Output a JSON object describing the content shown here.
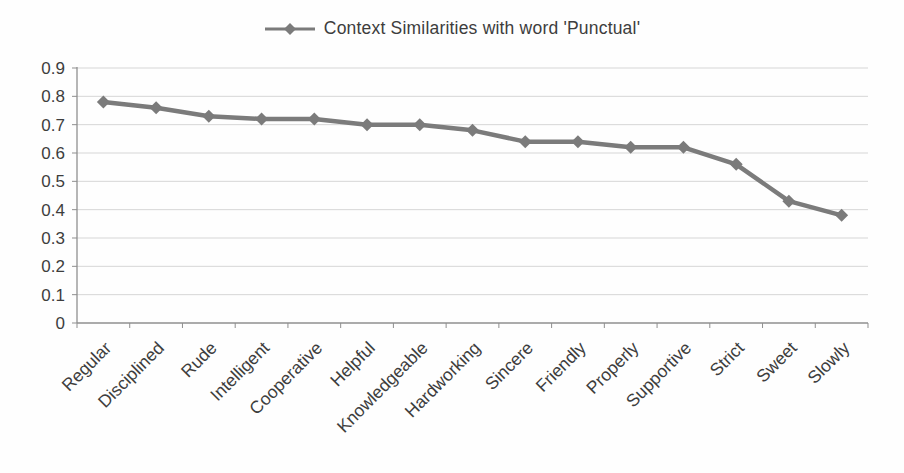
{
  "chart_data": {
    "type": "line",
    "title": "",
    "legend": "Context Similarities with word 'Punctual'",
    "legend_position": "top",
    "marker": "diamond",
    "grid": true,
    "categories": [
      "Regular",
      "Disciplined",
      "Rude",
      "Intelligent",
      "Cooperative",
      "Helpful",
      "Knowledgeable",
      "Hardworking",
      "Sincere",
      "Friendly",
      "Properly",
      "Supportive",
      "Strict",
      "Sweet",
      "Slowly"
    ],
    "values": [
      0.78,
      0.76,
      0.73,
      0.72,
      0.72,
      0.7,
      0.7,
      0.68,
      0.64,
      0.64,
      0.62,
      0.62,
      0.56,
      0.43,
      0.38
    ],
    "xlabel": "",
    "ylabel": "",
    "ylim": [
      0,
      0.9
    ],
    "yticks": [
      0,
      0.1,
      0.2,
      0.3,
      0.4,
      0.5,
      0.6,
      0.7,
      0.8,
      0.9
    ],
    "ytick_labels": [
      "0",
      "0.1",
      "0.2",
      "0.3",
      "0.4",
      "0.5",
      "0.6",
      "0.7",
      "0.8",
      "0.9"
    ],
    "colors": {
      "series": "#7b7b7b",
      "grid": "#d6d6d6",
      "axis": "#8f8f8f",
      "text": "#3d3d3d",
      "background": "#fefefe"
    }
  }
}
